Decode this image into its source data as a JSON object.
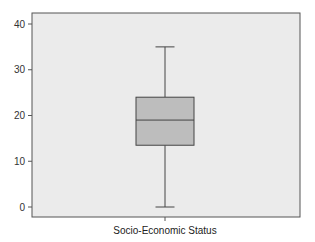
{
  "chart_data": {
    "type": "box",
    "title": "",
    "xlabel": "Socio-Economic Status",
    "ylabel": "",
    "categories": [
      "Socio-Economic Status"
    ],
    "ylim": [
      -2,
      42
    ],
    "yticks": [
      0,
      10,
      20,
      30,
      40
    ],
    "grid": false,
    "legend": null,
    "series": [
      {
        "name": "Socio-Economic Status",
        "whisker_low": 0,
        "q1": 13.5,
        "median": 19,
        "q3": 24,
        "whisker_high": 35
      }
    ],
    "colors": {
      "plot_background": "#ebebeb",
      "box_fill": "#bdbdbd",
      "lines": "#444444",
      "frame": "#555555"
    }
  }
}
